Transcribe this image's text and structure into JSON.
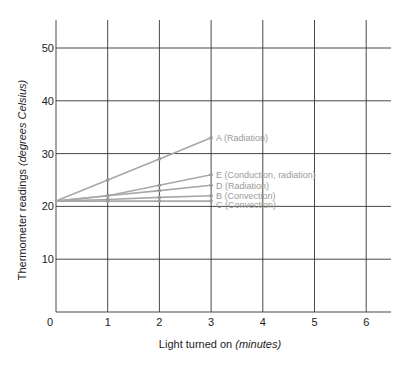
{
  "chart_data": {
    "type": "line",
    "title": "",
    "xlabel": "Light turned on",
    "xlabel_italic": "(minutes)",
    "ylabel": "Thermometer readings",
    "ylabel_italic": "(degrees Celsius)",
    "x_ticks": [
      "0",
      "1",
      "2",
      "3",
      "4",
      "5",
      "6"
    ],
    "y_ticks": [
      "10",
      "20",
      "30",
      "40",
      "50"
    ],
    "xlim": [
      0,
      6.5
    ],
    "ylim": [
      0,
      55
    ],
    "grid": true,
    "legend_position": "inline labels at line ends",
    "x": [
      0,
      1,
      2,
      3
    ],
    "series": [
      {
        "name": "A (Radiation)",
        "values": [
          21,
          25,
          29,
          33
        ]
      },
      {
        "name": "E (Conduction, radiation)",
        "values": [
          21,
          22,
          24,
          26
        ]
      },
      {
        "name": "D (Radiation)",
        "values": [
          21,
          22,
          23,
          24
        ]
      },
      {
        "name": "B (Convection)",
        "values": [
          21,
          21.3,
          21.7,
          22
        ]
      },
      {
        "name": "C (Convection)",
        "values": [
          21,
          21,
          21,
          21
        ]
      }
    ],
    "colors": {
      "series": "#a8a8a8",
      "grid": "#333333",
      "text": "#222222",
      "series_label": "#9a9a9a"
    }
  }
}
